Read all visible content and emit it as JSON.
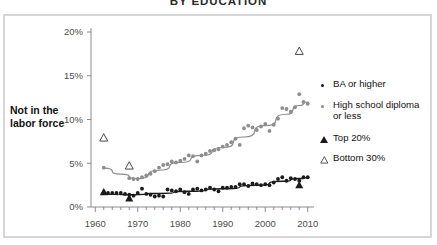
{
  "title": "BY EDUCATION",
  "axis": {
    "y_label_line1": "Not in the",
    "y_label_line2": "labor force",
    "y_ticks": [
      "0%",
      "5%",
      "10%",
      "15%",
      "20%"
    ],
    "x_ticks": [
      "1960",
      "1970",
      "1980",
      "1990",
      "2000",
      "2010"
    ]
  },
  "legend": {
    "items": [
      {
        "label": "BA or higher",
        "marker": "dot-dark-icon"
      },
      {
        "label": "High school diploma",
        "label2": "or less",
        "marker": "dot-gray-icon"
      },
      {
        "label": "Top 20%",
        "marker": "triangle-solid-icon"
      },
      {
        "label": "Bottom 30%",
        "marker": "triangle-open-icon"
      }
    ]
  },
  "colors": {
    "series_ba": "#1a1a1a",
    "series_hs": "#8d8d8d",
    "trend_ba": "#1a1a1a",
    "trend_hs": "#8d8d8d",
    "frame": "#d6d6d6",
    "axis": "#8a8a8a",
    "tick_text": "#4d4d4d"
  },
  "chart_data": {
    "type": "scatter",
    "title": "BY EDUCATION",
    "xlabel": "",
    "ylabel": "Not in the labor force",
    "xlim": [
      1959,
      2011
    ],
    "ylim": [
      0,
      20
    ],
    "y_unit": "percent",
    "grid": false,
    "legend_position": "right",
    "y_ticks": [
      0,
      5,
      10,
      15,
      20
    ],
    "x_ticks": [
      1960,
      1970,
      1980,
      1990,
      2000,
      2010
    ],
    "series": [
      {
        "name": "BA or higher",
        "marker": "filled-circle",
        "color": "#1a1a1a",
        "x": [
          1962,
          1963,
          1964,
          1965,
          1966,
          1967,
          1968,
          1969,
          1970,
          1971,
          1972,
          1973,
          1974,
          1975,
          1976,
          1977,
          1978,
          1979,
          1980,
          1981,
          1982,
          1983,
          1984,
          1985,
          1986,
          1987,
          1988,
          1989,
          1990,
          1991,
          1992,
          1993,
          1994,
          1995,
          1996,
          1997,
          1998,
          1999,
          2000,
          2001,
          2002,
          2003,
          2004,
          2005,
          2006,
          2007,
          2008,
          2009,
          2010
        ],
        "y": [
          1.7,
          1.6,
          1.6,
          1.6,
          1.6,
          1.5,
          1.4,
          1.3,
          1.6,
          2.1,
          1.5,
          1.4,
          1.2,
          1.3,
          1.2,
          2.0,
          1.9,
          1.8,
          2.0,
          1.7,
          1.5,
          2.0,
          2.1,
          1.9,
          2.0,
          2.2,
          2.0,
          1.8,
          2.2,
          2.2,
          2.3,
          2.3,
          2.6,
          2.6,
          2.4,
          2.7,
          2.6,
          2.5,
          2.6,
          2.5,
          2.8,
          3.2,
          3.4,
          3.0,
          3.3,
          3.2,
          3.0,
          3.4,
          3.4
        ],
        "trend": {
          "x": [
            1962,
            1969,
            1975,
            1982,
            1990,
            1998,
            2004,
            2008,
            2010
          ],
          "y": [
            1.45,
            1.4,
            1.55,
            1.8,
            2.1,
            2.5,
            2.95,
            3.25,
            3.35
          ]
        }
      },
      {
        "name": "High school diploma or less",
        "marker": "filled-circle",
        "color": "#8d8d8d",
        "x": [
          1962,
          1968,
          1969,
          1970,
          1971,
          1972,
          1973,
          1974,
          1975,
          1976,
          1977,
          1978,
          1979,
          1980,
          1981,
          1982,
          1983,
          1984,
          1985,
          1986,
          1987,
          1988,
          1989,
          1990,
          1991,
          1992,
          1993,
          1994,
          1995,
          1996,
          1997,
          1998,
          1999,
          2000,
          2001,
          2002,
          2003,
          2004,
          2005,
          2006,
          2007,
          2008,
          2009,
          2010
        ],
        "y": [
          4.5,
          3.3,
          3.2,
          3.2,
          3.4,
          3.6,
          3.8,
          4.1,
          4.5,
          4.8,
          4.9,
          5.2,
          5.1,
          5.3,
          5.5,
          5.9,
          5.8,
          5.2,
          5.9,
          6.1,
          6.4,
          6.5,
          6.6,
          6.9,
          7.1,
          7.4,
          7.8,
          7.1,
          9.0,
          9.3,
          9.1,
          8.8,
          9.2,
          9.5,
          8.7,
          9.4,
          10.1,
          11.3,
          11.2,
          10.9,
          11.4,
          12.9,
          12.0,
          11.8
        ],
        "trend": {
          "x": [
            1962,
            1966,
            1970,
            1975,
            1980,
            1985,
            1990,
            1995,
            2000,
            2005,
            2008,
            2010
          ],
          "y": [
            4.45,
            3.75,
            3.25,
            4.2,
            5.1,
            5.9,
            6.8,
            8.0,
            9.3,
            10.6,
            11.6,
            12.0
          ]
        }
      },
      {
        "name": "Top 20%",
        "marker": "filled-triangle",
        "color": "#1a1a1a",
        "x": [
          1962,
          1968,
          2008
        ],
        "y": [
          1.7,
          1.0,
          2.5
        ]
      },
      {
        "name": "Bottom 30%",
        "marker": "open-triangle",
        "color": "#1a1a1a",
        "x": [
          1962,
          1968,
          2008
        ],
        "y": [
          7.9,
          4.7,
          17.8
        ]
      }
    ]
  }
}
